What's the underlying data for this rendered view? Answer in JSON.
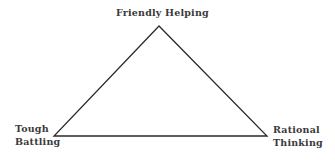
{
  "diagram": {
    "type": "triangle",
    "stroke_color": "#2a2a2a",
    "background": "#ffffff",
    "vertices": {
      "top": {
        "x": 159,
        "y": 26
      },
      "bottom_left": {
        "x": 54,
        "y": 136
      },
      "bottom_right": {
        "x": 267,
        "y": 136
      }
    },
    "labels": {
      "top": {
        "line1": "Friendly Helping"
      },
      "bottom_left": {
        "line1": "Tough",
        "line2": "Battling"
      },
      "bottom_right": {
        "line1": "Rational",
        "line2": "Thinking"
      }
    }
  }
}
